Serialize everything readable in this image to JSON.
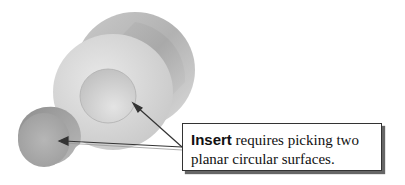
{
  "figure": {
    "callout": {
      "keyword": "Insert",
      "line1_rest": " requires picking two",
      "line2": "planar circular surfaces."
    },
    "arrows": [
      {
        "target": "recess-bottom-face",
        "from": [
          182,
          148
        ],
        "to": [
          133,
          103
        ]
      },
      {
        "target": "small-cylinder-end-face",
        "from": [
          182,
          148
        ],
        "to": [
          60,
          141
        ]
      }
    ],
    "colors": {
      "line": "#333333",
      "shadow": "#666666",
      "surface_light": "#dcdcdc",
      "surface_dark": "#9a9a9a"
    }
  }
}
